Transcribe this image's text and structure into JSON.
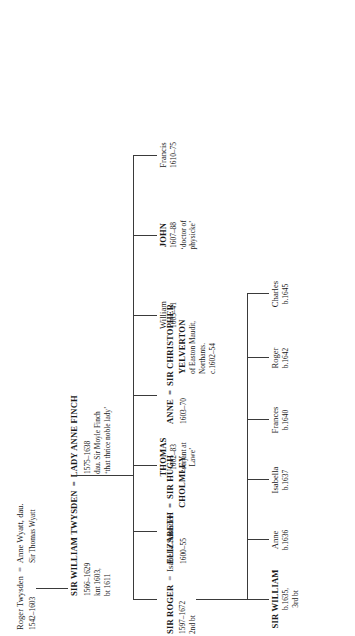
{
  "orientation": "rotated-90",
  "generations": [
    {
      "id": "gen0",
      "nodes": [
        {
          "id": "roger-twysden-anne-wyatt",
          "name": "Roger Twysden",
          "eq": "=",
          "spouse": "Anne Wyatt, dau.",
          "spouse_line2": "Sir Thomas Wyatt",
          "dates": "1542–1603"
        }
      ]
    },
    {
      "id": "gen1",
      "nodes": [
        {
          "id": "sir-william-twysden",
          "name": "SIR WILLIAM TWYSDEN",
          "eq": "=",
          "spouse": "LADY ANNE FINCH",
          "dates": "1566–1629",
          "note1": "knt 1603,",
          "note2": "bt 1611",
          "spouse_dates": "1575–1638",
          "spouse_note1": "dau. Sir Moyle Finch",
          "spouse_note2": "‘that thrice noble lady’"
        }
      ]
    },
    {
      "id": "gen2",
      "nodes": [
        {
          "id": "sir-roger",
          "name": "SIR ROGER",
          "eq": "=",
          "spouse": "Isabella Saunder",
          "dates": "1597–1672",
          "note1": "2nd bt"
        },
        {
          "id": "elizabeth-cholmley",
          "name": "ELIZABETH",
          "eq": "=",
          "spouse": "SIR HUGH",
          "spouse_line2": "CHOLMLEY",
          "dates": "1600–55"
        },
        {
          "id": "thomas",
          "name": "THOMAS",
          "dates": "1602–83",
          "note1": "‘serjant at",
          "note2": "Lawe’"
        },
        {
          "id": "anne-yelverton",
          "name": "ANNE",
          "eq": "=",
          "spouse": "SIR CHRISTOPHER",
          "spouse_line2": "YELVERTON",
          "dates": "1603–70",
          "spouse_note1": "of Easton Maudit,",
          "spouse_note2": "Northants.",
          "spouse_dates": "c.1602–54"
        },
        {
          "id": "william",
          "name": "William",
          "dates": "1605–41"
        },
        {
          "id": "john",
          "name": "JOHN",
          "dates": "1607–88",
          "note1": "‘doctor of",
          "note2": "physicke’"
        },
        {
          "id": "francis",
          "name": "Francis",
          "dates": "1610–75"
        }
      ]
    },
    {
      "id": "gen3",
      "nodes": [
        {
          "id": "sir-william-3rd-bt",
          "name": "SIR WILLIAM",
          "dates": "b.1635,",
          "note1": "3rd bt"
        },
        {
          "id": "anne-1636",
          "name": "Anne",
          "dates": "b.1636"
        },
        {
          "id": "isabella-1637",
          "name": "Isabella",
          "dates": "b.1637"
        },
        {
          "id": "frances-1640",
          "name": "Frances",
          "dates": "b.1640"
        },
        {
          "id": "roger-1642",
          "name": "Roger",
          "dates": "b.1642"
        },
        {
          "id": "charles-1645",
          "name": "Charles",
          "dates": "b.1645"
        }
      ]
    }
  ]
}
